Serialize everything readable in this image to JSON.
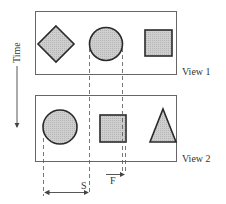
{
  "diagram": {
    "axis": {
      "label": "Time",
      "direction": "down"
    },
    "views": [
      {
        "label": "View 1",
        "shapes": [
          "diamond",
          "circle",
          "square"
        ]
      },
      {
        "label": "View 2",
        "shapes": [
          "circle",
          "square",
          "triangle"
        ]
      }
    ],
    "measurements": [
      {
        "label": "S",
        "description": "displacement between circle positions across views"
      },
      {
        "label": "F",
        "description": "small offset of square edge relative to previous circle edge"
      }
    ],
    "colors": {
      "fill": "#c8c8c8",
      "stroke": "#2a2a2a",
      "frame": "#666666"
    }
  }
}
